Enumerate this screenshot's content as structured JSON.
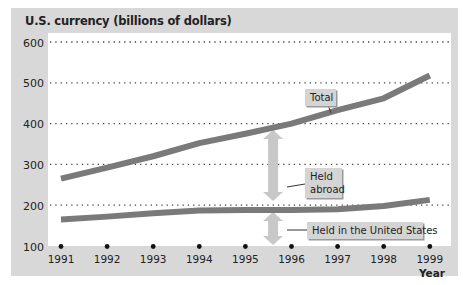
{
  "chart_data": {
    "type": "line",
    "title": "U.S. currency (billions of dollars)",
    "xlabel": "Year",
    "ylabel": "",
    "x": [
      1991,
      1992,
      1993,
      1994,
      1995,
      1996,
      1997,
      1998,
      1999
    ],
    "ylim": [
      100,
      600
    ],
    "yticks": [
      100,
      200,
      300,
      400,
      500,
      600
    ],
    "grid": "horizontal dotted",
    "series": [
      {
        "name": "Total",
        "values": [
          265,
          292,
          320,
          352,
          375,
          400,
          433,
          462,
          518
        ]
      },
      {
        "name": "Held in the United States",
        "values": [
          165,
          172,
          180,
          187,
          188,
          188,
          190,
          198,
          213
        ]
      }
    ],
    "annotations": [
      {
        "text": "Total",
        "target": "Total line near 1996"
      },
      {
        "text": "Held abroad",
        "target": "double arrow between Total and Held in the United States at 1995.6"
      },
      {
        "text": "Held in the United States",
        "target": "double arrow between 100 axis and lower line at 1995.6"
      }
    ],
    "colors": {
      "line": "#7a7a7a",
      "arrow": "#c8c8c8",
      "label_box": "#d4d4d4",
      "background": "#d8d8d8",
      "plot": "#ffffff"
    }
  }
}
